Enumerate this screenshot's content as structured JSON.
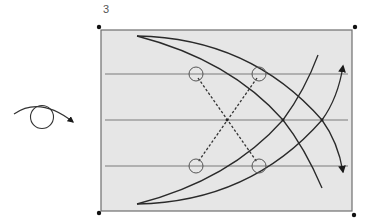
{
  "figure": {
    "panel_number": "3",
    "colors": {
      "field_fill": "#e6e6e6",
      "field_border": "#6e6e6e",
      "guide_line": "#7a7a7a",
      "curve": "#2a2a2a",
      "corner_dot": "#111111"
    },
    "rotation_icon": "clockwise-rotation-icon",
    "field": {
      "x": 101,
      "y": 30,
      "width": 251,
      "height": 181
    },
    "corner_markers": [
      {
        "x": 99,
        "y": 27
      },
      {
        "x": 355,
        "y": 27
      },
      {
        "x": 99,
        "y": 213
      },
      {
        "x": 354,
        "y": 215
      }
    ],
    "horizontal_lines_y": [
      74,
      120,
      166
    ],
    "circles": [
      {
        "x": 196,
        "y": 74
      },
      {
        "x": 259,
        "y": 74
      },
      {
        "x": 196,
        "y": 166
      },
      {
        "x": 259,
        "y": 166
      }
    ],
    "dashed_crossing_point": {
      "x": 227,
      "y": 120
    }
  }
}
